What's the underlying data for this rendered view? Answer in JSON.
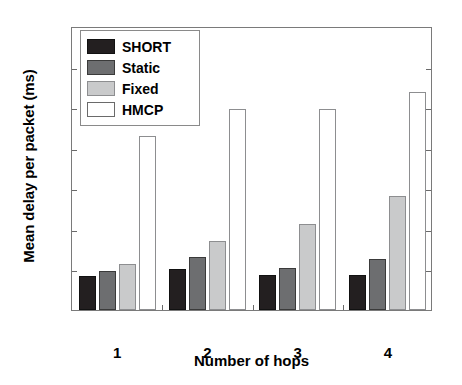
{
  "chart_data": {
    "type": "bar",
    "title": "",
    "xlabel": "Number of hops",
    "ylabel": "Mean delay per packet (ms)",
    "categories": [
      "1",
      "2",
      "3",
      "4"
    ],
    "ylim": [
      0,
      14
    ],
    "yticks": [
      0,
      2,
      4,
      6,
      8,
      10,
      12,
      14
    ],
    "ytick_labels": [
      "0",
      "2",
      "4",
      "6",
      "8",
      "10",
      "12",
      "14"
    ],
    "grid": false,
    "legend_position": "upper left",
    "series": [
      {
        "name": "SHORT",
        "color": "#231f20",
        "values": [
          1.7,
          2.0,
          1.75,
          1.75
        ]
      },
      {
        "name": "Static",
        "color": "#6d6e70",
        "values": [
          1.9,
          2.6,
          2.05,
          2.5
        ]
      },
      {
        "name": "Fixed",
        "color": "#c9cacb",
        "values": [
          2.25,
          3.4,
          4.25,
          5.6
        ]
      },
      {
        "name": "HMCP",
        "color": "#ffffff",
        "values": [
          8.6,
          9.9,
          9.9,
          10.75
        ]
      }
    ]
  },
  "axes": {
    "y_label": "Mean delay per packet (ms)",
    "x_label": "Number of hops"
  },
  "legend": {
    "items": [
      {
        "label": "SHORT"
      },
      {
        "label": "Static"
      },
      {
        "label": "Fixed"
      },
      {
        "label": "HMCP"
      }
    ]
  }
}
